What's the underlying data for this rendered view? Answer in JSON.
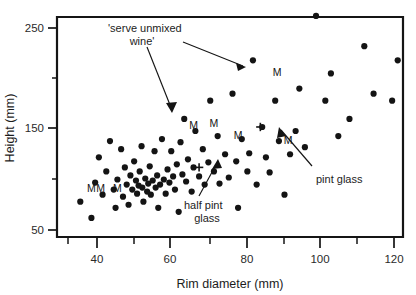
{
  "chart_data": {
    "type": "scatter",
    "title": "",
    "xlabel": "Rim diameter (mm)",
    "ylabel": "Height (mm)",
    "xlim": [
      32,
      126
    ],
    "ylim": [
      42,
      268
    ],
    "x_ticks_major": [
      40,
      60,
      80,
      100,
      120
    ],
    "x_ticks_minor": [
      35,
      45,
      50,
      55,
      65,
      70,
      75,
      85,
      90,
      95,
      105,
      110,
      115,
      125
    ],
    "x_tick_labels": [
      "40",
      "60",
      "80",
      "100",
      "120"
    ],
    "y_ticks_major": [
      50,
      150,
      250
    ],
    "y_ticks_minor": [
      100,
      200
    ],
    "y_tick_labels": [
      "50",
      "150",
      "250"
    ],
    "grid": false,
    "legend": "none",
    "point_color": "#141414",
    "points": [
      {
        "x": 35.5,
        "y": 78
      },
      {
        "x": 38.5,
        "y": 62
      },
      {
        "x": 39.5,
        "y": 97
      },
      {
        "x": 40.5,
        "y": 122
      },
      {
        "x": 41.5,
        "y": 85
      },
      {
        "x": 42.5,
        "y": 108
      },
      {
        "x": 43.5,
        "y": 138
      },
      {
        "x": 44.5,
        "y": 90
      },
      {
        "x": 45.0,
        "y": 72
      },
      {
        "x": 45.5,
        "y": 100
      },
      {
        "x": 46.5,
        "y": 130
      },
      {
        "x": 47.0,
        "y": 83
      },
      {
        "x": 47.5,
        "y": 112
      },
      {
        "x": 48.0,
        "y": 95
      },
      {
        "x": 48.5,
        "y": 75
      },
      {
        "x": 49.0,
        "y": 104
      },
      {
        "x": 49.5,
        "y": 90
      },
      {
        "x": 50.0,
        "y": 118
      },
      {
        "x": 50.5,
        "y": 99
      },
      {
        "x": 50.8,
        "y": 86
      },
      {
        "x": 51.2,
        "y": 94
      },
      {
        "x": 51.5,
        "y": 108
      },
      {
        "x": 52.0,
        "y": 133
      },
      {
        "x": 52.2,
        "y": 92
      },
      {
        "x": 52.5,
        "y": 78
      },
      {
        "x": 53.0,
        "y": 101
      },
      {
        "x": 53.5,
        "y": 88
      },
      {
        "x": 53.8,
        "y": 96
      },
      {
        "x": 54.2,
        "y": 113
      },
      {
        "x": 54.5,
        "y": 85
      },
      {
        "x": 55.0,
        "y": 99
      },
      {
        "x": 55.5,
        "y": 128
      },
      {
        "x": 55.8,
        "y": 92
      },
      {
        "x": 56.2,
        "y": 104
      },
      {
        "x": 56.5,
        "y": 72
      },
      {
        "x": 57.0,
        "y": 95
      },
      {
        "x": 57.5,
        "y": 140
      },
      {
        "x": 58.0,
        "y": 100
      },
      {
        "x": 58.5,
        "y": 86
      },
      {
        "x": 59.0,
        "y": 110
      },
      {
        "x": 59.5,
        "y": 97
      },
      {
        "x": 60.0,
        "y": 128
      },
      {
        "x": 60.5,
        "y": 103
      },
      {
        "x": 61.0,
        "y": 90
      },
      {
        "x": 61.5,
        "y": 115
      },
      {
        "x": 62.0,
        "y": 68
      },
      {
        "x": 62.5,
        "y": 137
      },
      {
        "x": 63.0,
        "y": 105
      },
      {
        "x": 63.5,
        "y": 160
      },
      {
        "x": 64.0,
        "y": 98
      },
      {
        "x": 64.5,
        "y": 120
      },
      {
        "x": 65.5,
        "y": 88
      },
      {
        "x": 66.0,
        "y": 112
      },
      {
        "x": 66.5,
        "y": 148
      },
      {
        "x": 67.5,
        "y": 103
      },
      {
        "x": 68.5,
        "y": 130
      },
      {
        "x": 69.0,
        "y": 95
      },
      {
        "x": 70.0,
        "y": 117
      },
      {
        "x": 70.5,
        "y": 178
      },
      {
        "x": 71.5,
        "y": 108
      },
      {
        "x": 72.5,
        "y": 143
      },
      {
        "x": 73.0,
        "y": 96
      },
      {
        "x": 74.5,
        "y": 125
      },
      {
        "x": 75.5,
        "y": 102
      },
      {
        "x": 76.5,
        "y": 185
      },
      {
        "x": 77.5,
        "y": 118
      },
      {
        "x": 78.0,
        "y": 72
      },
      {
        "x": 79.0,
        "y": 140
      },
      {
        "x": 80.5,
        "y": 108
      },
      {
        "x": 81.0,
        "y": 126
      },
      {
        "x": 82.0,
        "y": 218
      },
      {
        "x": 83.0,
        "y": 95
      },
      {
        "x": 84.5,
        "y": 152
      },
      {
        "x": 85.5,
        "y": 122
      },
      {
        "x": 86.5,
        "y": 107
      },
      {
        "x": 88.0,
        "y": 178
      },
      {
        "x": 89.0,
        "y": 138
      },
      {
        "x": 90.5,
        "y": 85
      },
      {
        "x": 92.0,
        "y": 125
      },
      {
        "x": 93.5,
        "y": 148
      },
      {
        "x": 94.5,
        "y": 190
      },
      {
        "x": 96.0,
        "y": 132
      },
      {
        "x": 99.0,
        "y": 262
      },
      {
        "x": 101.5,
        "y": 178
      },
      {
        "x": 103.0,
        "y": 205
      },
      {
        "x": 105.0,
        "y": 143
      },
      {
        "x": 108.0,
        "y": 160
      },
      {
        "x": 112.0,
        "y": 232
      },
      {
        "x": 114.5,
        "y": 185
      },
      {
        "x": 119.5,
        "y": 178
      },
      {
        "x": 121.0,
        "y": 218
      }
    ],
    "plus_markers": [
      {
        "x": 67.5,
        "y": 112,
        "label": "half pint glass"
      },
      {
        "x": 84.0,
        "y": 152,
        "label": "pint glass"
      }
    ],
    "letter_markers": [
      {
        "x": 38.5,
        "y": 88,
        "text": "M"
      },
      {
        "x": 41.0,
        "y": 88,
        "text": "M"
      },
      {
        "x": 45.5,
        "y": 88,
        "text": "M"
      },
      {
        "x": 66.0,
        "y": 150,
        "text": "M"
      },
      {
        "x": 71.5,
        "y": 152,
        "text": "M"
      },
      {
        "x": 78.0,
        "y": 140,
        "text": "M"
      },
      {
        "x": 88.5,
        "y": 202,
        "text": "M"
      },
      {
        "x": 91.5,
        "y": 135,
        "text": "M"
      }
    ],
    "annotations": [
      {
        "name": "serve-unmixed-wine",
        "line1": "'serve unmixed",
        "line2": "wine'"
      },
      {
        "name": "half-pint-glass",
        "line1": "half pint",
        "line2": "glass"
      },
      {
        "name": "pint-glass",
        "line1": "pint glass",
        "line2": ""
      }
    ]
  }
}
